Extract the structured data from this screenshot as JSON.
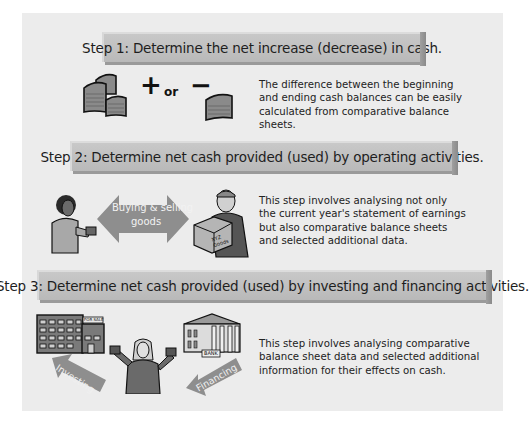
{
  "steps": [
    {
      "title": "Step 1: Determine the net increase (decrease) in cash.",
      "operator_plus": "+",
      "operator_or": "or",
      "operator_minus": "−",
      "description_lines": [
        "The difference between the beginning",
        "and ending cash balances can be easily",
        "calculated from comparative balance",
        "sheets."
      ],
      "icons": [
        "cash-stacks-icon",
        "cash-stack-icon"
      ]
    },
    {
      "title": "Step 2: Determine net cash provided (used) by operating activities.",
      "arrow_label_line1": "Buying & selling",
      "arrow_label_line2": "goods",
      "box_label": "XYZ Goods",
      "description_lines": [
        "This step involves analysing not only",
        "the current year's statement of earnings",
        "but also comparative balance sheets",
        "and selected additional data."
      ],
      "icons": [
        "buyer-person-icon",
        "double-arrow-icon",
        "seller-person-icon"
      ]
    },
    {
      "title": "Step 3: Determine net cash provided (used) by investing and financing activities.",
      "building_sign": "FOR SALE",
      "bank_sign": "BANK",
      "investing_label": "Investing",
      "financing_label": "Financing",
      "description_lines": [
        "This step involves analysing comparative",
        "balance sheet data and selected additional",
        "information for their effects on cash."
      ],
      "icons": [
        "office-building-icon",
        "bank-icon",
        "person-holding-cash-icon"
      ]
    }
  ],
  "colors": {
    "panel": "#ececec",
    "band": "#c0c0c0",
    "band_shadow": "#9a9a9a",
    "arrow": "#8e8e8e",
    "text": "#222222"
  }
}
